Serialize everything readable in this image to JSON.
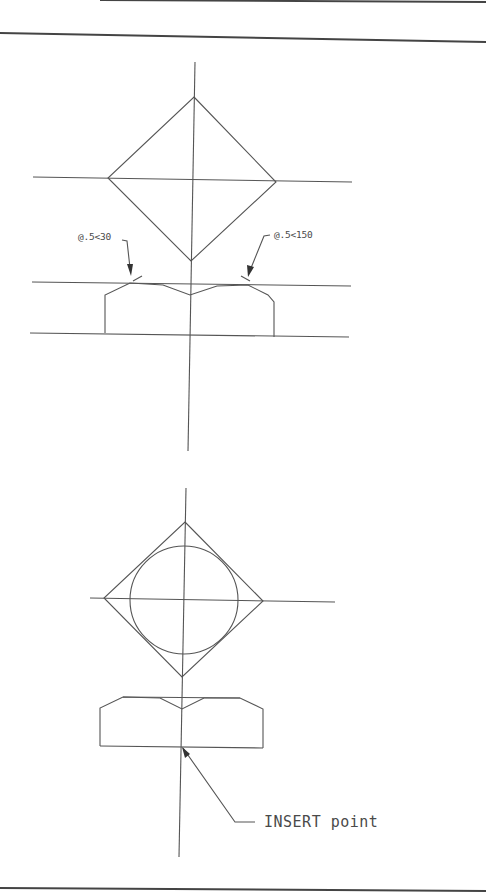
{
  "drawing": {
    "colors": {
      "line": "#555555",
      "border": "#444444",
      "text": "#4a4a4a",
      "background": "#ffffff"
    },
    "top_view": {
      "label_left": "@.5<30",
      "label_right": "@.5<150"
    },
    "bottom_view": {
      "insert_label": "INSERT point"
    }
  }
}
